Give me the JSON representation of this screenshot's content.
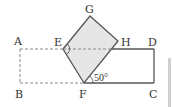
{
  "figure": {
    "points": {
      "A": {
        "label": "A",
        "x": 20,
        "y": 49
      },
      "B": {
        "label": "B",
        "x": 20,
        "y": 83
      },
      "C": {
        "label": "C",
        "x": 154,
        "y": 83
      },
      "D": {
        "label": "D",
        "x": 154,
        "y": 49
      },
      "E": {
        "label": "E",
        "x": 63,
        "y": 49
      },
      "F": {
        "label": "F",
        "x": 84,
        "y": 83
      },
      "G": {
        "label": "G",
        "x": 90,
        "y": 16
      },
      "H": {
        "label": "H",
        "x": 118,
        "y": 41
      }
    },
    "angle_label": "50°",
    "colors": {
      "stroke": "#555555",
      "dashed": "#888888",
      "fill": "#e6e6e6",
      "side_bar": "#d0d0d0"
    }
  }
}
